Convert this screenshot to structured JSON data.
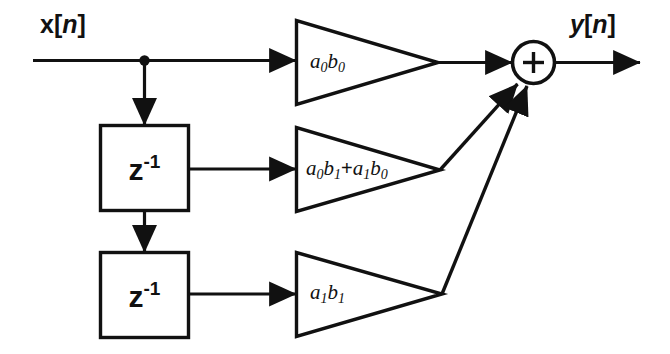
{
  "diagram": {
    "type": "signal-flow-block-diagram",
    "input": {
      "label_plain": "x[n]",
      "label_var": "x",
      "label_bracket_open": "[",
      "label_index": "n",
      "label_bracket_close": "]"
    },
    "output": {
      "label_plain": "y[n]",
      "label_var": "y",
      "label_bracket_open": "[",
      "label_index": "n",
      "label_bracket_close": "]"
    },
    "delays": [
      {
        "name": "delay-1",
        "label_base": "z",
        "label_exponent": "-1"
      },
      {
        "name": "delay-2",
        "label_base": "z",
        "label_exponent": "-1"
      }
    ],
    "gains": [
      {
        "name": "gain-top",
        "label_plain": "a0b0",
        "terms": [
          {
            "base": "a",
            "sub": "0"
          },
          {
            "base": "b",
            "sub": "0"
          }
        ]
      },
      {
        "name": "gain-middle",
        "label_plain": "a0b1+a1b0",
        "terms": [
          {
            "base": "a",
            "sub": "0"
          },
          {
            "base": "b",
            "sub": "1"
          },
          {
            "op": "+"
          },
          {
            "base": "a",
            "sub": "1"
          },
          {
            "base": "b",
            "sub": "0"
          }
        ]
      },
      {
        "name": "gain-bottom",
        "label_plain": "a1b1",
        "terms": [
          {
            "base": "a",
            "sub": "1"
          },
          {
            "base": "b",
            "sub": "1"
          }
        ]
      }
    ],
    "adder": {
      "name": "summing-junction",
      "symbol": "+"
    },
    "colors": {
      "line": "#111111",
      "background": "#ffffff",
      "fill": "#ffffff"
    }
  }
}
